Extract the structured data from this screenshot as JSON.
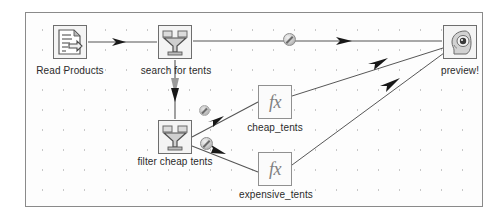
{
  "app": {
    "kind": "dataflow-pipeline-editor",
    "canvas_background": "#fdfdfd",
    "canvas_border_color": "#8a8a8a",
    "wire_color": "#555555",
    "node_border_color": "#6e6e6e",
    "label_color": "#2b2b2b"
  },
  "nodes": [
    {
      "id": "read-products",
      "label": "Read Products",
      "icon": "document-icon",
      "x": 53,
      "y": 25,
      "label_x": 29,
      "label_y": 65
    },
    {
      "id": "search-for-tents",
      "label": "search for tents",
      "icon": "funnel-icon",
      "x": 158,
      "y": 25,
      "label_x": 135,
      "label_y": 65
    },
    {
      "id": "filter-cheap-tents",
      "label": "filter cheap tents",
      "icon": "funnel-icon",
      "x": 158,
      "y": 120,
      "label_x": 130,
      "label_y": 156
    },
    {
      "id": "cheap-tents",
      "label": "cheap_tents",
      "icon": "fx-icon",
      "icon_text": "fx",
      "x": 258,
      "y": 85,
      "label_x": 236,
      "label_y": 122
    },
    {
      "id": "expensive-tents",
      "label": "expensive_tents",
      "icon": "fx-icon",
      "icon_text": "fx",
      "x": 258,
      "y": 152,
      "label_x": 229,
      "label_y": 189
    },
    {
      "id": "preview",
      "label": "preview!",
      "icon": "head-preview-icon",
      "x": 443,
      "y": 25,
      "label_x": 437,
      "label_y": 65
    }
  ],
  "connections": [
    {
      "id": "read-to-search",
      "from": "read-products",
      "to": "search-for-tents",
      "badge": "none"
    },
    {
      "id": "search-to-filter",
      "from": "search-for-tents",
      "to": "filter-cheap-tents",
      "badge": "none"
    },
    {
      "id": "search-to-preview",
      "from": "search-for-tents",
      "to": "preview",
      "badge": "disabled-badge"
    },
    {
      "id": "filter-to-cheap",
      "from": "filter-cheap-tents",
      "to": "cheap-tents",
      "badge": "disabled-badge"
    },
    {
      "id": "filter-to-expensive",
      "from": "filter-cheap-tents",
      "to": "expensive-tents",
      "badge": "disabled-badge"
    },
    {
      "id": "cheap-to-preview",
      "from": "cheap-tents",
      "to": "preview",
      "badge": "none"
    },
    {
      "id": "expensive-to-preview",
      "from": "expensive-tents",
      "to": "preview",
      "badge": "none"
    }
  ],
  "badges": [
    {
      "id": "badge-search-preview",
      "x": 283,
      "y": 33,
      "size": "normal"
    },
    {
      "id": "badge-filter-cheap",
      "x": 199,
      "y": 105,
      "size": "small"
    },
    {
      "id": "badge-filter-expensive",
      "x": 200,
      "y": 137,
      "size": "normal"
    }
  ]
}
